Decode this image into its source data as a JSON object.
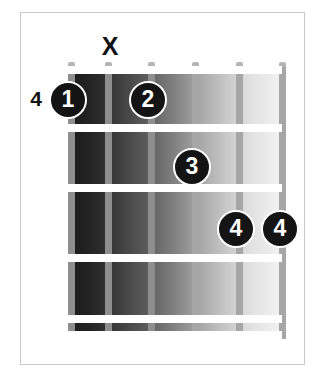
{
  "diagram": {
    "type": "guitar-chord-diagram",
    "starting_fret_label": "4",
    "strings_count": 6,
    "frets_count": 4,
    "colors": {
      "dot_fill": "#141414",
      "dot_text": "#ffffff",
      "fret_line": "#ffffff",
      "string": "#9a9a9a",
      "border": "#c9c9c9",
      "background": "#ffffff",
      "board_dark": "#1a1a1a",
      "board_light": "#f2f2f2"
    },
    "strings": [
      {
        "index": 1,
        "x": 0,
        "name": "string-6-low-e"
      },
      {
        "index": 2,
        "x": 37,
        "name": "string-5-a"
      },
      {
        "index": 3,
        "x": 80,
        "name": "string-4-d"
      },
      {
        "index": 4,
        "x": 124,
        "name": "string-3-g"
      },
      {
        "index": 5,
        "x": 168,
        "name": "string-2-b"
      },
      {
        "index": 6,
        "x": 211,
        "name": "string-1-high-e"
      }
    ],
    "fret_lines": [
      {
        "index": 0,
        "y": 0,
        "name": "nut-line"
      },
      {
        "index": 1,
        "y": 58,
        "name": "fret-line-1"
      },
      {
        "index": 2,
        "y": 118,
        "name": "fret-line-2"
      },
      {
        "index": 3,
        "y": 188,
        "name": "fret-line-3"
      },
      {
        "index": 4,
        "y": 249,
        "name": "fret-line-4"
      },
      {
        "index": 5,
        "y": 265,
        "name": "fret-line-5"
      }
    ],
    "fret_number": {
      "label": "4",
      "x": 36,
      "y": 98
    },
    "mute_markers": [
      {
        "label": "X",
        "x": 110,
        "y": 46,
        "string": 2
      }
    ],
    "finger_dots": [
      {
        "label": "1",
        "x": 68,
        "y": 100,
        "string": 1,
        "fret": 1
      },
      {
        "label": "2",
        "x": 148,
        "y": 100,
        "string": 3,
        "fret": 1
      },
      {
        "label": "3",
        "x": 192,
        "y": 167,
        "string": 4,
        "fret": 2
      },
      {
        "label": "4",
        "x": 236,
        "y": 229,
        "string": 5,
        "fret": 3
      },
      {
        "label": "4",
        "x": 280,
        "y": 229,
        "string": 6,
        "fret": 3
      }
    ]
  }
}
